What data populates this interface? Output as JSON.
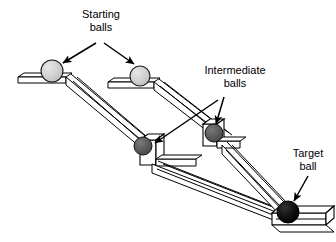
{
  "figure": {
    "type": "diagram",
    "background_color": "#ffffff",
    "line_color": "#000000",
    "width": 336,
    "height": 242
  },
  "labels": {
    "starting": {
      "line1": "Starting",
      "line2": "balls",
      "arrow_count": 2
    },
    "intermediate": {
      "line1": "Intermediate",
      "line2": "balls",
      "arrow_count": 2
    },
    "target": {
      "line1": "Target",
      "line2": "ball",
      "arrow_count": 1
    }
  },
  "balls": [
    {
      "name": "starting-ball-left",
      "kind": "starting",
      "cx": 52,
      "cy": 71,
      "r": 11,
      "fill": "#cccccc",
      "highlight": "#dcdcdc"
    },
    {
      "name": "starting-ball-right",
      "kind": "starting",
      "cx": 140,
      "cy": 76,
      "r": 10,
      "fill": "#d3d3d3",
      "highlight": "#e2e2e2"
    },
    {
      "name": "intermediate-ball-left",
      "kind": "intermediate",
      "cx": 143,
      "cy": 146,
      "r": 9,
      "fill": "#565656",
      "highlight": "#6e6e6e"
    },
    {
      "name": "intermediate-ball-right",
      "kind": "intermediate",
      "cx": 214,
      "cy": 133,
      "r": 9,
      "fill": "#595959",
      "highlight": "#707070"
    },
    {
      "name": "target-ball",
      "kind": "target",
      "cx": 288,
      "cy": 212,
      "r": 11,
      "fill": "#0a0a0a",
      "highlight": "#2a2a2a"
    }
  ],
  "tracks": [
    {
      "name": "upper-left-launch-platform",
      "orientation": "horizontal"
    },
    {
      "name": "upper-right-launch-platform",
      "orientation": "horizontal"
    },
    {
      "name": "left-upper-ramp",
      "orientation": "diagonal-down-right"
    },
    {
      "name": "right-upper-ramp",
      "orientation": "diagonal-down-right"
    },
    {
      "name": "left-lower-ramp",
      "orientation": "diagonal-down-right"
    },
    {
      "name": "right-lower-ramp",
      "orientation": "diagonal-down-right"
    },
    {
      "name": "target-platform",
      "orientation": "horizontal"
    }
  ]
}
